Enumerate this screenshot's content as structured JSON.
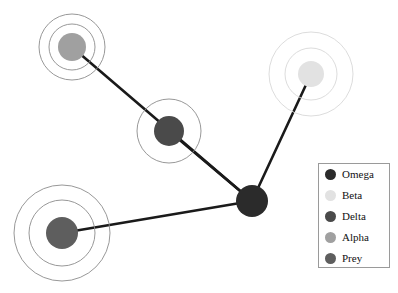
{
  "figure": {
    "width": 398,
    "height": 293,
    "background": "#ffffff",
    "type": "network-graph"
  },
  "chart_data": {
    "type": "scatter",
    "title": "",
    "xlabel": "",
    "ylabel": "",
    "grid": false,
    "legend_position": "right",
    "edge_color": "#1a1a1a",
    "edge_width": 2.6,
    "ring_color": "#8c8c8c",
    "ring_width": 0.9,
    "nodes": [
      {
        "id": "hub",
        "label": "Omega",
        "group": "Omega",
        "x": 252,
        "y": 201,
        "r": 16,
        "color": "#2b2b2b",
        "rings": []
      },
      {
        "id": "n-top-right",
        "label": "Beta",
        "group": "Beta",
        "x": 311,
        "y": 74,
        "r": 13,
        "color": "#e2e2e2",
        "rings": [
          26,
          42
        ]
      },
      {
        "id": "n-middle",
        "label": "Delta",
        "group": "Delta",
        "x": 169,
        "y": 131,
        "r": 15,
        "color": "#4a4a4a",
        "rings": [
          32
        ]
      },
      {
        "id": "n-top-left",
        "label": "Alpha",
        "group": "Alpha",
        "x": 72,
        "y": 47,
        "r": 14,
        "color": "#a0a0a0",
        "rings": [
          23,
          33
        ]
      },
      {
        "id": "n-bottom-left",
        "label": "Prey",
        "group": "Prey",
        "x": 62,
        "y": 233,
        "r": 16,
        "color": "#5e5e5e",
        "rings": [
          33,
          48
        ]
      }
    ],
    "edges": [
      {
        "from": "hub",
        "to": "n-top-left"
      },
      {
        "from": "hub",
        "to": "n-middle"
      },
      {
        "from": "hub",
        "to": "n-top-right"
      },
      {
        "from": "hub",
        "to": "n-bottom-left"
      }
    ]
  },
  "legend": {
    "box": {
      "x": 318,
      "y": 163,
      "width": 72,
      "height": 105
    },
    "font_size": 11,
    "swatch_size": 11,
    "entries": [
      {
        "label": "Omega",
        "color": "#2b2b2b"
      },
      {
        "label": "Beta",
        "color": "#e2e2e2"
      },
      {
        "label": "Delta",
        "color": "#4a4a4a"
      },
      {
        "label": "Alpha",
        "color": "#a0a0a0"
      },
      {
        "label": "Prey",
        "color": "#5e5e5e"
      }
    ]
  }
}
